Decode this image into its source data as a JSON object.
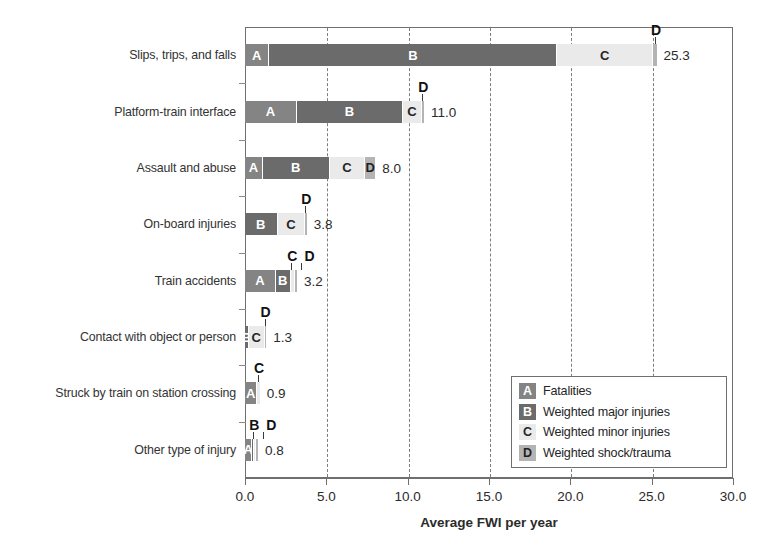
{
  "chart_data": {
    "type": "bar",
    "orientation": "horizontal",
    "stacked": true,
    "title": "",
    "xlabel": "Average FWI per year",
    "ylabel": "",
    "xlim": [
      0.0,
      30.0
    ],
    "xticks": [
      "0.0",
      "5.0",
      "10.0",
      "15.0",
      "20.0",
      "25.0",
      "30.0"
    ],
    "xtick_values": [
      0,
      5,
      10,
      15,
      20,
      25,
      30
    ],
    "grid": "vertical-dashed",
    "legend_position": "lower-right",
    "categories": [
      "Slips, trips, and falls",
      "Platform-train interface",
      "Assault and abuse",
      "On-board injuries",
      "Train accidents",
      "Contact with object or person",
      "Struck by train on station crossing",
      "Other type of injury"
    ],
    "series": [
      {
        "name": "Fatalities",
        "key": "A",
        "color": "#848484",
        "values": [
          1.5,
          3.2,
          1.1,
          0.0,
          1.9,
          0.0,
          0.75,
          0.45
        ]
      },
      {
        "name": "Weighted major injuries",
        "key": "B",
        "color": "#6b6b6b",
        "values": [
          17.7,
          6.5,
          4.1,
          2.0,
          0.9,
          0.25,
          0.0,
          0.1
        ]
      },
      {
        "name": "Weighted minor injuries",
        "key": "C",
        "color": "#eaeaea",
        "values": [
          5.9,
          1.2,
          2.2,
          1.7,
          0.25,
          0.95,
          0.15,
          0.15
        ]
      },
      {
        "name": "Weighted shock/trauma",
        "key": "D",
        "color": "#b4b4b4",
        "values": [
          0.2,
          0.1,
          0.6,
          0.1,
          0.15,
          0.1,
          0.0,
          0.1
        ]
      }
    ],
    "totals": [
      "25.3",
      "11.0",
      "8.0",
      "3.8",
      "3.2",
      "1.3",
      "0.9",
      "0.8"
    ],
    "total_values": [
      25.3,
      11.0,
      8.0,
      3.8,
      3.2,
      1.3,
      0.9,
      0.8
    ]
  },
  "axis": {
    "title": "Average FWI per year",
    "ticks": [
      {
        "label": "0.0",
        "value": 0
      },
      {
        "label": "5.0",
        "value": 5
      },
      {
        "label": "10.0",
        "value": 10
      },
      {
        "label": "15.0",
        "value": 15
      },
      {
        "label": "20.0",
        "value": 20
      },
      {
        "label": "25.0",
        "value": 25
      },
      {
        "label": "30.0",
        "value": 30
      }
    ]
  },
  "rows": [
    {
      "category": "Slips, trips, and falls",
      "total": "25.3",
      "segments": [
        {
          "letter": "A",
          "cls": "seg-a",
          "value": 1.5,
          "inline": true
        },
        {
          "letter": "B",
          "cls": "seg-b",
          "value": 17.7,
          "inline": true
        },
        {
          "letter": "C",
          "cls": "seg-c",
          "value": 5.9,
          "inline": true
        },
        {
          "letter": "D",
          "cls": "seg-d",
          "value": 0.2,
          "inline": false
        }
      ],
      "callouts": [
        {
          "letter": "D",
          "at": 25.2
        }
      ]
    },
    {
      "category": "Platform-train interface",
      "total": "11.0",
      "segments": [
        {
          "letter": "A",
          "cls": "seg-a",
          "value": 3.2,
          "inline": true
        },
        {
          "letter": "B",
          "cls": "seg-b",
          "value": 6.5,
          "inline": true
        },
        {
          "letter": "C",
          "cls": "seg-c",
          "value": 1.2,
          "inline": true
        },
        {
          "letter": "D",
          "cls": "seg-d",
          "value": 0.1,
          "inline": false
        }
      ],
      "callouts": [
        {
          "letter": "D",
          "at": 10.9
        }
      ]
    },
    {
      "category": "Assault and abuse",
      "total": "8.0",
      "segments": [
        {
          "letter": "A",
          "cls": "seg-a",
          "value": 1.1,
          "inline": true
        },
        {
          "letter": "B",
          "cls": "seg-b",
          "value": 4.1,
          "inline": true
        },
        {
          "letter": "C",
          "cls": "seg-c",
          "value": 2.2,
          "inline": true
        },
        {
          "letter": "D",
          "cls": "seg-d",
          "value": 0.6,
          "inline": true
        }
      ],
      "callouts": []
    },
    {
      "category": "On-board injuries",
      "total": "3.8",
      "segments": [
        {
          "letter": "B",
          "cls": "seg-b",
          "value": 2.0,
          "inline": true
        },
        {
          "letter": "C",
          "cls": "seg-c",
          "value": 1.7,
          "inline": true
        },
        {
          "letter": "D",
          "cls": "seg-d",
          "value": 0.1,
          "inline": false
        }
      ],
      "callouts": [
        {
          "letter": "D",
          "at": 3.7
        }
      ]
    },
    {
      "category": "Train accidents",
      "total": "3.2",
      "segments": [
        {
          "letter": "A",
          "cls": "seg-a",
          "value": 1.9,
          "inline": true
        },
        {
          "letter": "B",
          "cls": "seg-b",
          "value": 0.9,
          "inline": true
        },
        {
          "letter": "C",
          "cls": "seg-c",
          "value": 0.25,
          "inline": false
        },
        {
          "letter": "D",
          "cls": "seg-d",
          "value": 0.15,
          "inline": false
        }
      ],
      "callouts": [
        {
          "letter": "C",
          "at": 2.85
        },
        {
          "letter": "D",
          "at": 3.1
        }
      ]
    },
    {
      "category": "Contact with object or person",
      "total": "1.3",
      "segments": [
        {
          "letter": "B",
          "cls": "seg-b",
          "value": 0.25,
          "inline": true
        },
        {
          "letter": "C",
          "cls": "seg-c",
          "value": 0.95,
          "inline": true
        },
        {
          "letter": "D",
          "cls": "seg-d",
          "value": 0.1,
          "inline": false
        }
      ],
      "callouts": [
        {
          "letter": "D",
          "at": 1.2
        }
      ]
    },
    {
      "category": "Struck by train on station crossing",
      "total": "0.9",
      "segments": [
        {
          "letter": "A",
          "cls": "seg-a",
          "value": 0.75,
          "inline": true
        },
        {
          "letter": "C",
          "cls": "seg-c",
          "value": 0.15,
          "inline": false
        }
      ],
      "callouts": [
        {
          "letter": "C",
          "at": 0.8
        }
      ]
    },
    {
      "category": "Other type of injury",
      "total": "0.8",
      "segments": [
        {
          "letter": "A",
          "cls": "seg-a",
          "value": 0.45,
          "inline": true
        },
        {
          "letter": "B",
          "cls": "seg-b",
          "value": 0.1,
          "inline": false
        },
        {
          "letter": "C",
          "cls": "seg-c",
          "value": 0.15,
          "inline": false
        },
        {
          "letter": "D",
          "cls": "seg-d",
          "value": 0.1,
          "inline": false
        }
      ],
      "callouts": [
        {
          "letter": "B",
          "at": 0.5
        },
        {
          "letter": "D",
          "at": 0.75
        }
      ]
    }
  ],
  "legend": {
    "items": [
      {
        "letter": "A",
        "cls": "seg-a",
        "label": "Fatalities"
      },
      {
        "letter": "B",
        "cls": "seg-b",
        "label": "Weighted major injuries"
      },
      {
        "letter": "C",
        "cls": "seg-c",
        "label": "Weighted minor injuries"
      },
      {
        "letter": "D",
        "cls": "seg-d",
        "label": "Weighted shock/trauma"
      }
    ]
  }
}
